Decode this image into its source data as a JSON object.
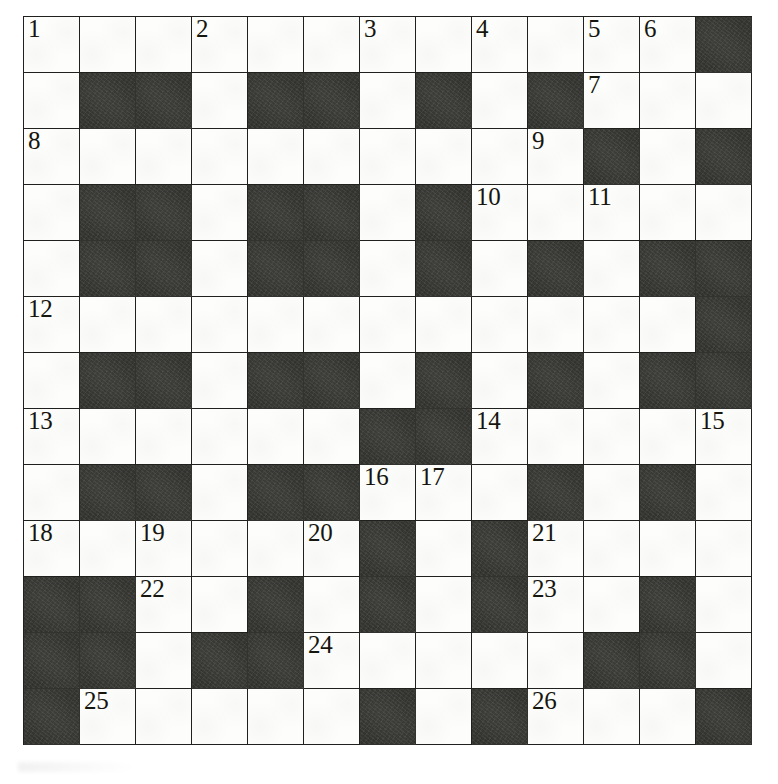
{
  "puzzle": {
    "title": "Crossword Grid",
    "columns": 13,
    "rows": 13,
    "cell_size_px": 56,
    "colors": {
      "block": "#32322f",
      "open": "#fdfdfb",
      "gridline": "#20201e",
      "number": "#16160f"
    },
    "legend": {
      "open_cell": "open-cell",
      "block_cell": "block-cell"
    },
    "grid": [
      [
        "W",
        "W",
        "W",
        "W",
        "W",
        "W",
        "W",
        "W",
        "W",
        "W",
        "W",
        "W",
        "B"
      ],
      [
        "W",
        "B",
        "B",
        "W",
        "B",
        "B",
        "W",
        "B",
        "W",
        "B",
        "W",
        "W",
        "W"
      ],
      [
        "W",
        "W",
        "W",
        "W",
        "W",
        "W",
        "W",
        "W",
        "W",
        "W",
        "B",
        "W",
        "B"
      ],
      [
        "W",
        "B",
        "B",
        "W",
        "B",
        "B",
        "W",
        "B",
        "W",
        "W",
        "W",
        "W",
        "W"
      ],
      [
        "W",
        "B",
        "B",
        "W",
        "B",
        "B",
        "W",
        "B",
        "W",
        "B",
        "W",
        "B",
        "B"
      ],
      [
        "W",
        "W",
        "W",
        "W",
        "W",
        "W",
        "W",
        "W",
        "W",
        "W",
        "W",
        "W",
        "B"
      ],
      [
        "W",
        "B",
        "B",
        "W",
        "B",
        "B",
        "W",
        "B",
        "W",
        "B",
        "W",
        "B",
        "B"
      ],
      [
        "W",
        "W",
        "W",
        "W",
        "W",
        "W",
        "B",
        "B",
        "W",
        "W",
        "W",
        "W",
        "W"
      ],
      [
        "W",
        "B",
        "B",
        "W",
        "B",
        "B",
        "W",
        "W",
        "W",
        "B",
        "W",
        "B",
        "W"
      ],
      [
        "W",
        "W",
        "W",
        "W",
        "W",
        "W",
        "B",
        "W",
        "B",
        "W",
        "W",
        "W",
        "W"
      ],
      [
        "B",
        "B",
        "W",
        "W",
        "B",
        "W",
        "B",
        "W",
        "B",
        "W",
        "W",
        "B",
        "W"
      ],
      [
        "B",
        "B",
        "W",
        "B",
        "B",
        "W",
        "W",
        "W",
        "W",
        "W",
        "B",
        "B",
        "W"
      ],
      [
        "B",
        "W",
        "W",
        "W",
        "W",
        "W",
        "B",
        "W",
        "B",
        "W",
        "W",
        "W",
        "B"
      ]
    ],
    "numbers": [
      {
        "label": "1",
        "row": 1,
        "col": 1
      },
      {
        "label": "2",
        "row": 1,
        "col": 4
      },
      {
        "label": "3",
        "row": 1,
        "col": 7
      },
      {
        "label": "4",
        "row": 1,
        "col": 9
      },
      {
        "label": "5",
        "row": 1,
        "col": 11
      },
      {
        "label": "6",
        "row": 1,
        "col": 12
      },
      {
        "label": "7",
        "row": 2,
        "col": 11
      },
      {
        "label": "8",
        "row": 3,
        "col": 1
      },
      {
        "label": "9",
        "row": 3,
        "col": 10
      },
      {
        "label": "10",
        "row": 4,
        "col": 9
      },
      {
        "label": "11",
        "row": 4,
        "col": 11
      },
      {
        "label": "12",
        "row": 6,
        "col": 1
      },
      {
        "label": "13",
        "row": 8,
        "col": 1
      },
      {
        "label": "14",
        "row": 8,
        "col": 9
      },
      {
        "label": "15",
        "row": 8,
        "col": 13
      },
      {
        "label": "16",
        "row": 9,
        "col": 7
      },
      {
        "label": "17",
        "row": 9,
        "col": 8
      },
      {
        "label": "18",
        "row": 10,
        "col": 1
      },
      {
        "label": "19",
        "row": 10,
        "col": 3
      },
      {
        "label": "20",
        "row": 10,
        "col": 6
      },
      {
        "label": "21",
        "row": 10,
        "col": 10
      },
      {
        "label": "22",
        "row": 11,
        "col": 3
      },
      {
        "label": "23",
        "row": 11,
        "col": 10
      },
      {
        "label": "24",
        "row": 12,
        "col": 6
      },
      {
        "label": "25",
        "row": 13,
        "col": 2
      },
      {
        "label": "26",
        "row": 13,
        "col": 10
      }
    ]
  }
}
